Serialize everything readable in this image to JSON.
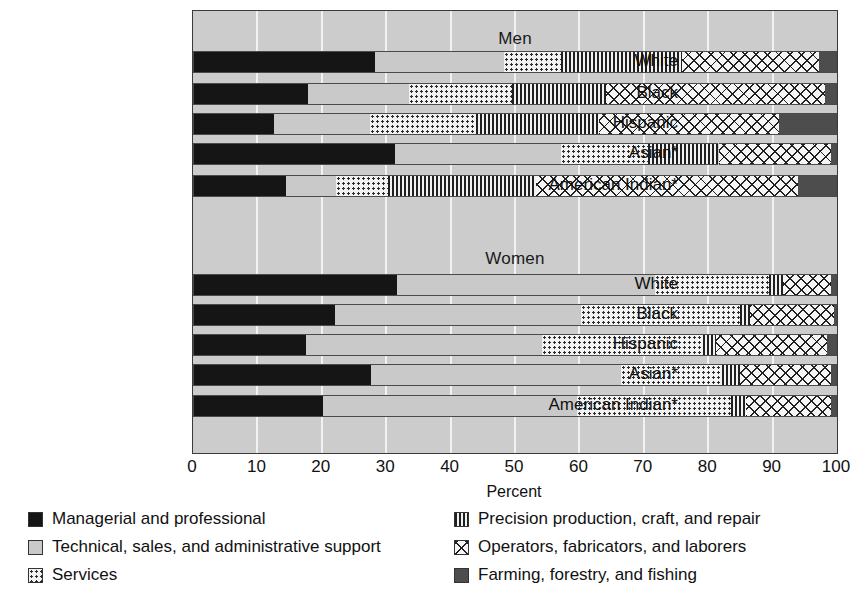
{
  "chart_data": {
    "type": "bar",
    "subtype": "stacked-horizontal-100pct",
    "title": "",
    "xlabel": "Percent",
    "ylabel": "",
    "xlim": [
      0,
      100
    ],
    "xticks": [
      0,
      10,
      20,
      30,
      40,
      50,
      60,
      70,
      80,
      90,
      100
    ],
    "grid": true,
    "legend_position": "bottom",
    "panels": [
      {
        "label": "Men",
        "categories": [
          "White",
          "Black",
          "Hispanic",
          "Asian*",
          "American Indian*"
        ],
        "series": [
          {
            "name": "Managerial and professional",
            "values": [
              28.3,
              17.8,
              12.6,
              31.4,
              14.4
            ]
          },
          {
            "name": "Technical, sales, and administrative support",
            "values": [
              20.0,
              15.7,
              14.9,
              25.8,
              7.8
            ]
          },
          {
            "name": "Services",
            "values": [
              8.8,
              16.0,
              16.5,
              13.5,
              8.1
            ]
          },
          {
            "name": "Precision production, craft, and repair",
            "values": [
              18.8,
              14.6,
              19.0,
              10.9,
              22.9
            ]
          },
          {
            "name": "Operators, fabricators, and laborers",
            "values": [
              21.3,
              34.0,
              28.0,
              17.4,
              40.8
            ]
          },
          {
            "name": "Farming, forestry, and fishing",
            "values": [
              2.8,
              1.9,
              9.0,
              1.0,
              6.0
            ]
          }
        ]
      },
      {
        "label": "Women",
        "categories": [
          "White",
          "Black",
          "Hispanic",
          "Asian*",
          "American Indian*"
        ],
        "series": [
          {
            "name": "Managerial and professional",
            "values": [
              31.7,
              22.0,
              17.6,
              27.6,
              20.2
            ]
          },
          {
            "name": "Technical, sales, and administrative support",
            "values": [
              40.0,
              38.2,
              36.6,
              38.9,
              39.4
            ]
          },
          {
            "name": "Services",
            "values": [
              17.7,
              24.8,
              25.0,
              15.6,
              24.0
            ]
          },
          {
            "name": "Precision production, craft, and repair",
            "values": [
              2.2,
              1.5,
              2.0,
              2.8,
              2.2
            ]
          },
          {
            "name": "Operators, fabricators, and laborers",
            "values": [
              7.5,
              13.0,
              17.3,
              14.1,
              13.2
            ]
          },
          {
            "name": "Farming, forestry, and fishing",
            "values": [
              0.9,
              0.5,
              1.5,
              1.0,
              1.0
            ]
          }
        ]
      }
    ],
    "legend": [
      {
        "name": "Managerial and professional",
        "pattern": "solid-black",
        "color": "#151515"
      },
      {
        "name": "Technical, sales, and administrative support",
        "pattern": "solid-lightgray",
        "color": "#c9c9c9"
      },
      {
        "name": "Services",
        "pattern": "dotted",
        "color": "#f2f2f2"
      },
      {
        "name": "Precision production, craft, and repair",
        "pattern": "vertical-lines",
        "color": "#f2f2f2"
      },
      {
        "name": "Operators, fabricators, and laborers",
        "pattern": "cross-hatch",
        "color": "#f5f5f5"
      },
      {
        "name": "Farming, forestry, and fishing",
        "pattern": "solid-darkgray",
        "color": "#4d4d4d"
      }
    ],
    "footnote_marker": "*"
  }
}
